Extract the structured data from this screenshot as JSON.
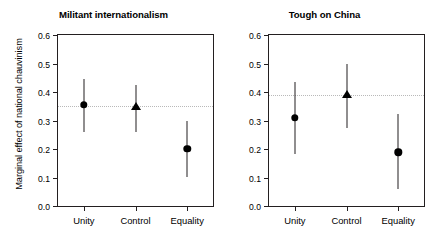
{
  "chart_data": {
    "type": "scatter",
    "title": "",
    "panels": [
      {
        "title": "Militant internationalism",
        "xlabel": "",
        "ylabel": "Marginal effect of national chauvinism",
        "ylim": [
          0.0,
          0.6
        ],
        "yticks": [
          "0.0",
          "0.1",
          "0.2",
          "0.3",
          "0.4",
          "0.5",
          "0.6"
        ],
        "ytick_values": [
          0.0,
          0.1,
          0.2,
          0.3,
          0.4,
          0.5,
          0.6
        ],
        "categories": [
          "Unity",
          "Control",
          "Equality"
        ],
        "grid": false,
        "reference_line": 0.35,
        "points": [
          {
            "category": "Unity",
            "marker": "circle",
            "estimate": 0.355,
            "ci_low": 0.26,
            "ci_high": 0.445
          },
          {
            "category": "Control",
            "marker": "triangle",
            "estimate": 0.348,
            "ci_low": 0.26,
            "ci_high": 0.425
          },
          {
            "category": "Equality",
            "marker": "circle",
            "estimate": 0.2,
            "ci_low": 0.1,
            "ci_high": 0.299
          }
        ]
      },
      {
        "title": "Tough on China",
        "xlabel": "",
        "ylabel": "",
        "ylim": [
          0.0,
          0.6
        ],
        "yticks": [
          "0.0",
          "0.1",
          "0.2",
          "0.3",
          "0.4",
          "0.5",
          "0.6"
        ],
        "ytick_values": [
          0.0,
          0.1,
          0.2,
          0.3,
          0.4,
          0.5,
          0.6
        ],
        "categories": [
          "Unity",
          "Control",
          "Equality"
        ],
        "grid": false,
        "reference_line": 0.39,
        "points": [
          {
            "category": "Unity",
            "marker": "circle",
            "estimate": 0.31,
            "ci_low": 0.183,
            "ci_high": 0.435
          },
          {
            "category": "Control",
            "marker": "triangle",
            "estimate": 0.39,
            "ci_low": 0.275,
            "ci_high": 0.5
          },
          {
            "category": "Equality",
            "marker": "circle",
            "estimate": 0.188,
            "ci_low": 0.058,
            "ci_high": 0.322
          }
        ]
      }
    ],
    "colors": {
      "marker": "#000000",
      "axis": "#231f20",
      "reference_line": "#b9b9b9"
    }
  }
}
